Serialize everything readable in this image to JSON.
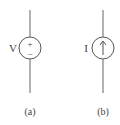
{
  "figures": [
    {
      "id": "a",
      "type": "voltage-source",
      "symbol_label": "V",
      "polarity_top": "+",
      "polarity_bottom": "−",
      "caption": "(a)"
    },
    {
      "id": "b",
      "type": "current-source",
      "symbol_label": "I",
      "arrow_direction": "up",
      "caption": "(b)"
    }
  ],
  "colors": {
    "stroke": "#555555",
    "text": "#444444"
  }
}
